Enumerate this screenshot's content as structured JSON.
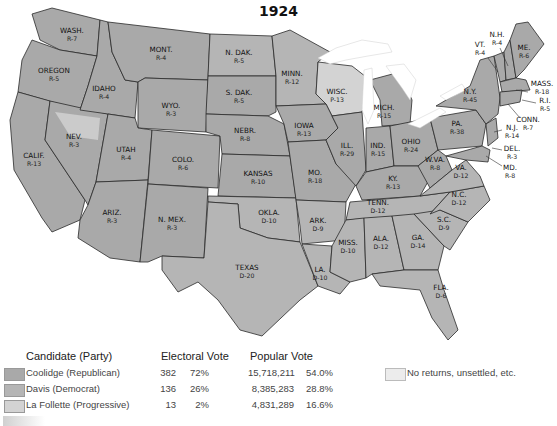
{
  "title": "1924",
  "colors": {
    "republican": "#a9a9a9",
    "democrat": "#b5b5b5",
    "progressive": "#d3d3d3",
    "no_returns": "#ececec",
    "state_border": "#2a2a2a"
  },
  "states": [
    {
      "abbr": "WASH.",
      "result": "R-7"
    },
    {
      "abbr": "OREGON",
      "result": "R-5"
    },
    {
      "abbr": "CALIF.",
      "result": "R-13"
    },
    {
      "abbr": "IDAHO",
      "result": "R-4"
    },
    {
      "abbr": "NEV.",
      "result": "R-3"
    },
    {
      "abbr": "MONT.",
      "result": "R-4"
    },
    {
      "abbr": "WYO.",
      "result": "R-3"
    },
    {
      "abbr": "UTAH",
      "result": "R-4"
    },
    {
      "abbr": "ARIZ.",
      "result": "R-3"
    },
    {
      "abbr": "COLO.",
      "result": "R-6"
    },
    {
      "abbr": "N. MEX.",
      "result": "R-3"
    },
    {
      "abbr": "N. DAK.",
      "result": "R-5"
    },
    {
      "abbr": "S. DAK.",
      "result": "R-5"
    },
    {
      "abbr": "NEBR.",
      "result": "R-8"
    },
    {
      "abbr": "KANSAS",
      "result": "R-10"
    },
    {
      "abbr": "OKLA.",
      "result": "D-10"
    },
    {
      "abbr": "TEXAS",
      "result": "D-20"
    },
    {
      "abbr": "MINN.",
      "result": "R-12"
    },
    {
      "abbr": "IOWA",
      "result": "R-13"
    },
    {
      "abbr": "MO.",
      "result": "R-18"
    },
    {
      "abbr": "ARK.",
      "result": "D-9"
    },
    {
      "abbr": "LA.",
      "result": "D-10"
    },
    {
      "abbr": "WISC.",
      "result": "P-13"
    },
    {
      "abbr": "ILL.",
      "result": "R-29"
    },
    {
      "abbr": "MICH.",
      "result": "R-15"
    },
    {
      "abbr": "IND.",
      "result": "R-15"
    },
    {
      "abbr": "OHIO",
      "result": "R-24"
    },
    {
      "abbr": "KY.",
      "result": "R-13"
    },
    {
      "abbr": "TENN.",
      "result": "D-12"
    },
    {
      "abbr": "MISS.",
      "result": "D-10"
    },
    {
      "abbr": "ALA.",
      "result": "D-12"
    },
    {
      "abbr": "GA.",
      "result": "D-14"
    },
    {
      "abbr": "FLA.",
      "result": "D-6"
    },
    {
      "abbr": "S.C.",
      "result": "D-9"
    },
    {
      "abbr": "N.C.",
      "result": "D-12"
    },
    {
      "abbr": "VA.",
      "result": "D-12"
    },
    {
      "abbr": "W.VA.",
      "result": "R-8"
    },
    {
      "abbr": "PA.",
      "result": "R-38"
    },
    {
      "abbr": "N.Y.",
      "result": "R-45"
    },
    {
      "abbr": "VT.",
      "result": "R-4"
    },
    {
      "abbr": "N.H.",
      "result": "R-4"
    },
    {
      "abbr": "ME.",
      "result": "R-6"
    },
    {
      "abbr": "MASS.",
      "result": "R-18"
    },
    {
      "abbr": "R.I.",
      "result": "R-5"
    },
    {
      "abbr": "CONN.",
      "result": "R-7"
    },
    {
      "abbr": "N.J.",
      "result": "R-14"
    },
    {
      "abbr": "DEL.",
      "result": "R-3"
    },
    {
      "abbr": "MD.",
      "result": "R-8"
    }
  ],
  "legend": {
    "headers": {
      "candidate": "Candidate (Party)",
      "electoral": "Electoral Vote",
      "popular": "Popular Vote"
    },
    "rows": [
      {
        "candidate": "Coolidge (Republican)",
        "ev": "382",
        "ev_pct": "72%",
        "pv": "15,718,211",
        "pv_pct": "54.0%"
      },
      {
        "candidate": "Davis (Democrat)",
        "ev": "136",
        "ev_pct": "26%",
        "pv": "8,385,283",
        "pv_pct": "28.8%"
      },
      {
        "candidate": "La Follette (Progressive)",
        "ev": "13",
        "ev_pct": "2%",
        "pv": "4,831,289",
        "pv_pct": "16.6%"
      }
    ],
    "no_returns": "No returns, unsettled, etc."
  }
}
